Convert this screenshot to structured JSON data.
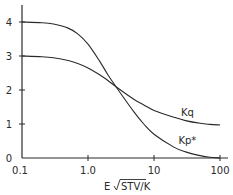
{
  "chart_data": {
    "type": "line",
    "title": "",
    "xlabel": "E √STV/K",
    "xlabel_prefix": "E",
    "xlabel_radicand": "STV/K",
    "ylabel": "",
    "xscale": "log",
    "xlim": [
      0.1,
      100
    ],
    "ylim": [
      0,
      4.4
    ],
    "grid": false,
    "legend": "inline labels",
    "x_ticks": [
      {
        "value": 0.1,
        "label": "0.1"
      },
      {
        "value": 1.0,
        "label": "1.0"
      },
      {
        "value": 10,
        "label": "10"
      },
      {
        "value": 100,
        "label": "100"
      }
    ],
    "y_ticks": [
      {
        "value": 0,
        "label": "0"
      },
      {
        "value": 1,
        "label": "1"
      },
      {
        "value": 2,
        "label": "2"
      },
      {
        "value": 3,
        "label": "3"
      },
      {
        "value": 4,
        "label": "4"
      }
    ],
    "series": [
      {
        "name": "Kq",
        "label": "Kq",
        "x": [
          0.1,
          0.2,
          0.3,
          0.5,
          0.7,
          1.0,
          1.5,
          2.0,
          3.0,
          5.0,
          7.0,
          10,
          20,
          30,
          50,
          70,
          100
        ],
        "values": [
          3.0,
          2.98,
          2.95,
          2.87,
          2.78,
          2.65,
          2.45,
          2.28,
          2.02,
          1.72,
          1.56,
          1.4,
          1.2,
          1.1,
          1.02,
          0.99,
          0.97
        ],
        "label_position": {
          "x": 32,
          "y": 1.25
        }
      },
      {
        "name": "Kp*",
        "label": "Kp*",
        "x": [
          0.1,
          0.2,
          0.3,
          0.5,
          0.7,
          1.0,
          1.5,
          2.0,
          3.0,
          5.0,
          7.0,
          10,
          20,
          30,
          50,
          70,
          100
        ],
        "values": [
          4.0,
          3.98,
          3.94,
          3.82,
          3.65,
          3.35,
          2.85,
          2.45,
          1.95,
          1.35,
          1.0,
          0.7,
          0.32,
          0.18,
          0.07,
          0.02,
          0.0
        ],
        "label_position": {
          "x": 32,
          "y": 0.42
        }
      }
    ]
  }
}
